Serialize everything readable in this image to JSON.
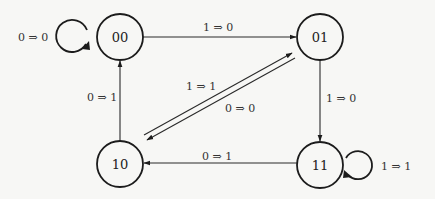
{
  "diagram": {
    "type": "state-transition-diagram",
    "states": [
      {
        "id": "00",
        "label": "00",
        "cx": 120,
        "cy": 37
      },
      {
        "id": "01",
        "label": "01",
        "cx": 320,
        "cy": 37
      },
      {
        "id": "10",
        "label": "10",
        "cx": 120,
        "cy": 164
      },
      {
        "id": "11",
        "label": "11",
        "cx": 320,
        "cy": 165
      }
    ],
    "transitions": [
      {
        "from": "00",
        "to": "00",
        "label": "0 ⇒ 0"
      },
      {
        "from": "00",
        "to": "01",
        "label": "1 ⇒ 0"
      },
      {
        "from": "01",
        "to": "11",
        "label": "1 ⇒ 0"
      },
      {
        "from": "01",
        "to": "10",
        "label": "0 ⇒ 0"
      },
      {
        "from": "10",
        "to": "01",
        "label": "1 ⇒ 1"
      },
      {
        "from": "10",
        "to": "00",
        "label": "0 ⇒ 1"
      },
      {
        "from": "11",
        "to": "10",
        "label": "0 ⇒ 1"
      },
      {
        "from": "11",
        "to": "11",
        "label": "1 ⇒ 1"
      }
    ],
    "colors": {
      "background": "#f7f7f5",
      "stroke": "#1c1c1c"
    }
  }
}
